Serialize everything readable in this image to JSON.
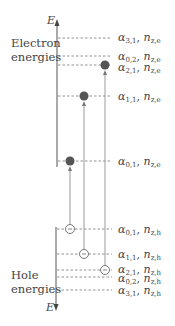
{
  "diagram": {
    "axis_label": "E",
    "electron_section_label_line1": "Electron",
    "electron_section_label_line2": "energies",
    "hole_section_label_line1": "Hole",
    "hole_section_label_line2": "energies",
    "electron_levels": [
      {
        "alpha_sub": "3,1",
        "n_sub": "z,e",
        "y": 38
      },
      {
        "alpha_sub": "0,2",
        "n_sub": "z,e",
        "y": 56
      },
      {
        "alpha_sub": "2,1",
        "n_sub": "z,e",
        "y": 65
      },
      {
        "alpha_sub": "1,1",
        "n_sub": "z,e",
        "y": 96
      },
      {
        "alpha_sub": "0,1",
        "n_sub": "z,e",
        "y": 161
      }
    ],
    "hole_levels": [
      {
        "alpha_sub": "0,1",
        "n_sub": "z,h",
        "y": 229
      },
      {
        "alpha_sub": "1,1",
        "n_sub": "z,h",
        "y": 254
      },
      {
        "alpha_sub": "2,1",
        "n_sub": "z,h",
        "y": 270
      },
      {
        "alpha_sub": "0,2",
        "n_sub": "z,h",
        "y": 277
      },
      {
        "alpha_sub": "3,1",
        "n_sub": "z,h",
        "y": 290
      }
    ],
    "transitions": [
      {
        "from": "hole α0,1",
        "to": "electron α0,1",
        "x": 70
      },
      {
        "from": "hole α1,1",
        "to": "electron α1,1",
        "x": 84
      },
      {
        "from": "hole α2,1",
        "to": "electron α2,1",
        "x": 105
      }
    ],
    "colors": {
      "line": "#555555",
      "dash": "#666666",
      "dot": "#555555",
      "transition": "#999999"
    }
  }
}
